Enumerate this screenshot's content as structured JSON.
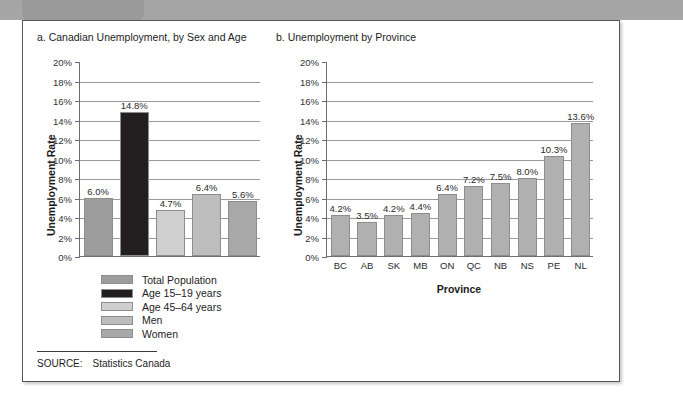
{
  "figure": {
    "source_label": "SOURCE:",
    "source_text": "Statistics Canada",
    "axis_color": "#6e6e6e",
    "grid_color": "#9a9a9a"
  },
  "panel_a": {
    "title": "a. Canadian Unemployment, by Sex and Age",
    "ylabel": "Unemployment Rate",
    "legend": [
      {
        "label": "Total Population",
        "color": "#9d9d9d"
      },
      {
        "label": "Age 15–19 years",
        "color": "#231f20"
      },
      {
        "label": "Age 45–64 years",
        "color": "#cfcfcf"
      },
      {
        "label": "Men",
        "color": "#bdbdbd"
      },
      {
        "label": "Women",
        "color": "#a8a8a8"
      }
    ]
  },
  "panel_b": {
    "title": "b. Unemployment by Province",
    "ylabel": "Unemployment Rate",
    "xlabel": "Province",
    "bar_color": "#b0b0b0"
  },
  "chart_data": [
    {
      "type": "bar",
      "title": "a. Canadian Unemployment, by Sex and Age",
      "xlabel": "",
      "ylabel": "Unemployment Rate",
      "ylim": [
        0,
        20
      ],
      "ytick_labels": [
        "0%",
        "2%",
        "4%",
        "6%",
        "8%",
        "10%",
        "12%",
        "14%",
        "16%",
        "18%",
        "20%"
      ],
      "ytick_values": [
        0,
        2,
        4,
        6,
        8,
        10,
        12,
        14,
        16,
        18,
        20
      ],
      "grid": true,
      "legend_position": "below-plot",
      "categories": [
        "Total Population",
        "Age 15–19 years",
        "Age 45–64 years",
        "Men",
        "Women"
      ],
      "values": [
        6.0,
        14.8,
        4.7,
        6.4,
        5.6
      ],
      "data_labels": [
        "6.0%",
        "14.8%",
        "4.7%",
        "6.4%",
        "5.6%"
      ],
      "colors": [
        "#9d9d9d",
        "#231f20",
        "#cfcfcf",
        "#bdbdbd",
        "#a8a8a8"
      ]
    },
    {
      "type": "bar",
      "title": "b. Unemployment by Province",
      "xlabel": "Province",
      "ylabel": "Unemployment Rate",
      "ylim": [
        0,
        20
      ],
      "ytick_labels": [
        "0%",
        "2%",
        "4%",
        "6%",
        "8%",
        "10%",
        "12%",
        "14%",
        "16%",
        "18%",
        "20%"
      ],
      "ytick_values": [
        0,
        2,
        4,
        6,
        8,
        10,
        12,
        14,
        16,
        18,
        20
      ],
      "grid": true,
      "legend_position": "none",
      "categories": [
        "BC",
        "AB",
        "SK",
        "MB",
        "ON",
        "QC",
        "NB",
        "NS",
        "PE",
        "NL"
      ],
      "values": [
        4.2,
        3.5,
        4.2,
        4.4,
        6.4,
        7.2,
        7.5,
        8.0,
        10.3,
        13.6
      ],
      "data_labels": [
        "4.2%",
        "3.5%",
        "4.2%",
        "4.4%",
        "6.4%",
        "7.2%",
        "7.5%",
        "8.0%",
        "10.3%",
        "13.6%"
      ],
      "colors": [
        "#b0b0b0",
        "#b0b0b0",
        "#b0b0b0",
        "#b0b0b0",
        "#b0b0b0",
        "#b0b0b0",
        "#b0b0b0",
        "#b0b0b0",
        "#b0b0b0",
        "#b0b0b0"
      ]
    }
  ]
}
